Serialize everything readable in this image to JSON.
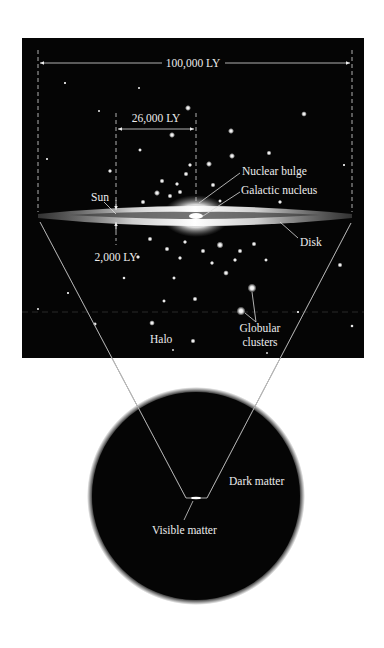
{
  "panel": {
    "background": "#050505",
    "dimensions": {
      "galaxy_diameter": "100,000 LY",
      "sun_distance": "26,000 LY",
      "disk_thickness": "2,000 LY"
    },
    "labels": {
      "sun": "Sun",
      "nuclear_bulge": "Nuclear bulge",
      "galactic_nucleus": "Galactic nucleus",
      "disk": "Disk",
      "halo": "Halo",
      "globular_clusters_line1": "Globular",
      "globular_clusters_line2": "clusters"
    }
  },
  "halo_circle": {
    "background": "#050505",
    "labels": {
      "dark_matter": "Dark matter",
      "visible_matter": "Visible matter"
    }
  }
}
